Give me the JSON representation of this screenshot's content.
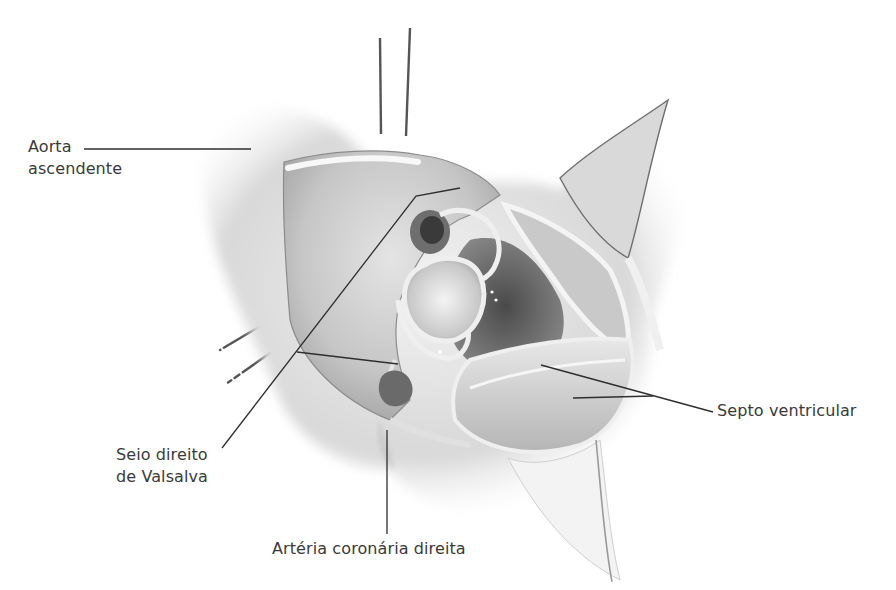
{
  "figure": {
    "colors": {
      "background": "#ffffff",
      "label_text": "#3a3a3a",
      "leader_line": "#2e2e2e",
      "tissue_light": "#eeeeee",
      "tissue_mid": "#bdbdbd",
      "tissue_dark": "#5a5a5a"
    }
  },
  "labels": {
    "aorta": {
      "line1": "Aorta",
      "line2": "ascendente"
    },
    "seio": {
      "line1": "Seio direito",
      "line2": "de Valsalva"
    },
    "arteria": {
      "text": "Artéria coronária direita"
    },
    "septo": {
      "text": "Septo ventricular"
    }
  }
}
